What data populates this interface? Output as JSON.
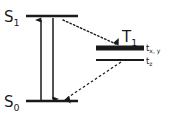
{
  "diagram": {
    "background_color": "#ffffff",
    "line_color": "#1a1a1a",
    "width": 175,
    "height": 120,
    "states": [
      {
        "id": "s1",
        "label": "S",
        "subscript": "1",
        "name": "first excited singlet state",
        "level_x1": 26,
        "level_x2": 78,
        "level_y": 16,
        "thickness": 2.6
      },
      {
        "id": "s0",
        "label": "S",
        "subscript": "0",
        "name": "ground singlet state",
        "level_x1": 26,
        "level_x2": 78,
        "level_y": 101,
        "thickness": 2.6
      },
      {
        "id": "t1",
        "label": "T",
        "subscript": "1",
        "name": "triplet state",
        "level_x1": 96,
        "level_x2": 144,
        "level_y": 48,
        "thickness": 5.2
      }
    ],
    "sublevels": [
      {
        "id": "txy",
        "label": "t",
        "subscript": "x, y",
        "full_label": "tx, ty",
        "level_x1": 96,
        "level_x2": 144,
        "level_y": 48,
        "thickness": 5.2,
        "label_x": 146,
        "label_y": 51
      },
      {
        "id": "tz",
        "label": "t",
        "subscript": "z",
        "full_label": "tz",
        "level_x1": 96,
        "level_x2": 144,
        "level_y": 60,
        "thickness": 2.2,
        "label_x": 146,
        "label_y": 64
      }
    ],
    "transitions": [
      {
        "id": "absorption",
        "name": "absorption",
        "style": "solid",
        "direction": "up",
        "x1": 41,
        "y1": 100,
        "x2": 41,
        "y2": 18
      },
      {
        "id": "fluorescence",
        "name": "fluorescence",
        "style": "solid",
        "direction": "down",
        "x1": 53,
        "y1": 18,
        "x2": 53,
        "y2": 100
      },
      {
        "id": "intersystem-crossing",
        "name": "intersystem crossing",
        "style": "dotted",
        "direction": "down-right",
        "x1": 63,
        "y1": 20,
        "x2": 118,
        "y2": 45
      },
      {
        "id": "phosphorescence",
        "name": "phosphorescence",
        "style": "dashed",
        "direction": "down-left",
        "x1": 121,
        "y1": 62,
        "x2": 65,
        "y2": 99
      }
    ],
    "labels": {
      "s1_x": 4,
      "s1_y": 22,
      "s0_x": 4,
      "s0_y": 107,
      "t1_x": 122,
      "t1_y": 42
    }
  }
}
